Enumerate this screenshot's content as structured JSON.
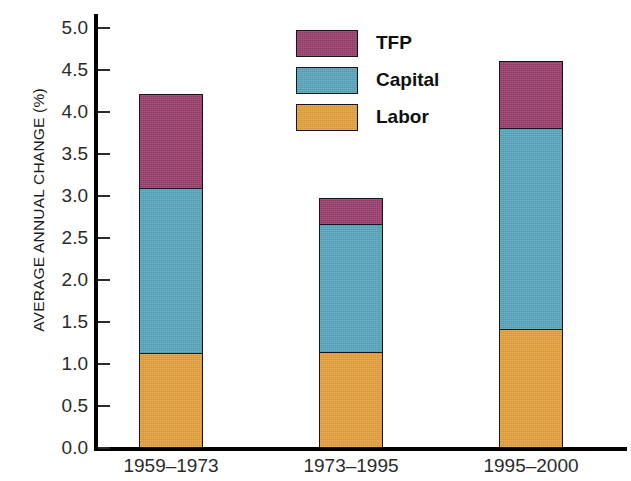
{
  "chart_data": {
    "type": "bar",
    "subtype": "stacked-bar",
    "title": "",
    "subtitle": "",
    "xlabel": "",
    "ylabel": "AVERAGE ANNUAL CHANGE (%)",
    "categories": [
      "1959–1973",
      "1973–1995",
      "1995–2000"
    ],
    "series": [
      {
        "name": "Labor",
        "values": [
          1.13,
          1.14,
          1.42
        ],
        "color": "#e8a33d"
      },
      {
        "name": "Capital",
        "values": [
          1.99,
          1.55,
          2.41
        ],
        "color": "#5aa8bf"
      },
      {
        "name": "TFP",
        "values": [
          1.13,
          0.33,
          0.82
        ],
        "color": "#9c3f6e"
      }
    ],
    "stack_order_bottom_to_top": [
      "Labor",
      "Capital",
      "TFP"
    ],
    "cumulative_tops": {
      "1959–1973": {
        "Labor": 1.13,
        "Capital": 3.12,
        "TFP": 4.25
      },
      "1973–1995": {
        "Labor": 1.14,
        "Capital": 2.69,
        "TFP": 3.02
      },
      "1995–2000": {
        "Labor": 1.42,
        "Capital": 3.83,
        "TFP": 4.65
      }
    },
    "totals": [
      4.25,
      3.02,
      4.65
    ],
    "ylim": [
      0.0,
      5.0
    ],
    "ytick_step": 0.5,
    "ytick_labels": [
      "5.0",
      "4.5",
      "4.0",
      "3.5",
      "3.0",
      "2.5",
      "2.0",
      "1.5",
      "1.0",
      "0.5",
      "0.0"
    ],
    "ytick_values": [
      5.0,
      4.5,
      4.0,
      3.5,
      3.0,
      2.5,
      2.0,
      1.5,
      1.0,
      0.5,
      0.0
    ],
    "grid": false,
    "legend_position": "top-center",
    "legend_entries": [
      {
        "label": "TFP",
        "color": "#9c3f6e"
      },
      {
        "label": "Capital",
        "color": "#5aa8bf"
      },
      {
        "label": "Labor",
        "color": "#e8a33d"
      }
    ],
    "axis_color": "#000000",
    "background_color": "#ffffff"
  }
}
